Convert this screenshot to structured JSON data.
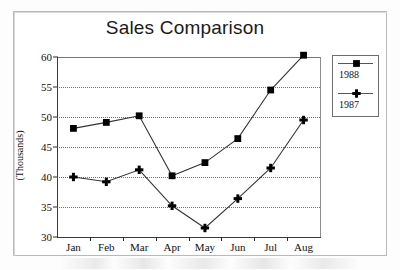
{
  "chart_data": {
    "type": "line",
    "title": "Sales Comparison",
    "xlabel": "",
    "ylabel": "(Thousands)",
    "categories": [
      "Jan",
      "Feb",
      "Mar",
      "Apr",
      "May",
      "Jun",
      "Jul",
      "Aug"
    ],
    "ylim": [
      30,
      60
    ],
    "yticks": [
      30,
      35,
      40,
      45,
      50,
      55,
      60
    ],
    "grid": true,
    "legend_position": "right",
    "series": [
      {
        "name": "1988",
        "marker": "square",
        "values": [
          48.1,
          49.1,
          50.2,
          40.2,
          42.4,
          46.4,
          54.5,
          60.3
        ]
      },
      {
        "name": "1987",
        "marker": "plus",
        "values": [
          40.0,
          39.2,
          41.2,
          35.2,
          31.5,
          36.4,
          41.5,
          49.5
        ]
      }
    ]
  },
  "legend": {
    "entries": [
      {
        "label": "1988",
        "marker": "square-marker-icon"
      },
      {
        "label": "1987",
        "marker": "plus-marker-icon"
      }
    ]
  },
  "colors": {
    "line": "#333333",
    "marker": "#000000",
    "grid": "#6f6f6f",
    "axis": "#2b2b2b",
    "text": "#111111",
    "frame": "#b9b9b9"
  }
}
